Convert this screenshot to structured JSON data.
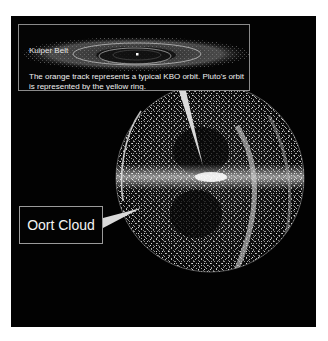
{
  "figure": {
    "type": "solar-system-diagram",
    "background_color": "#020202",
    "particle_color": "#d8d8d8"
  },
  "inset": {
    "label": "Kuiper Belt",
    "caption": "The orange track represents a typical KBO orbit. Pluto's orbit is represented by the yellow ring.",
    "border_color": "#8a8a8a"
  },
  "callout": {
    "label": "Oort Cloud",
    "border_color": "#9a9a9a"
  }
}
